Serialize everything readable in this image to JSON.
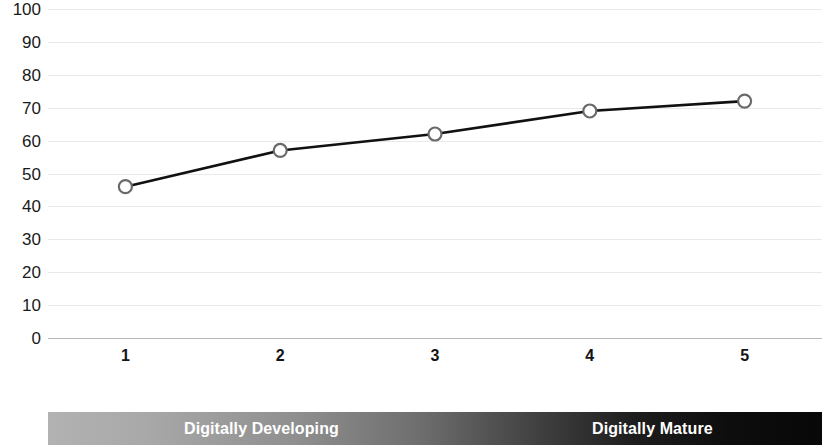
{
  "chart_data": {
    "type": "line",
    "title": "",
    "xlabel": "",
    "ylabel": "",
    "categories": [
      "1",
      "2",
      "3",
      "4",
      "5"
    ],
    "values": [
      46,
      57,
      62,
      69,
      72
    ],
    "series": [
      {
        "name": "Digital maturity score",
        "values": [
          46,
          57,
          62,
          69,
          72
        ]
      }
    ],
    "ylim": [
      0,
      100
    ],
    "y_ticks": [
      "100",
      "90",
      "80",
      "70",
      "60",
      "50",
      "40",
      "30",
      "20",
      "10",
      "0"
    ],
    "y_tick_values": [
      100,
      90,
      80,
      70,
      60,
      50,
      40,
      30,
      20,
      10,
      0
    ],
    "grid": true,
    "legend": "none",
    "marker": "open-circle",
    "line_color": "#111111",
    "marker_fill": "#ffffff",
    "marker_stroke": "#6a6a6a",
    "grid_color": "#e9e9e9",
    "axis_color": "#b8b8b8"
  },
  "spectrum": {
    "left_label": "Digitally Developing",
    "right_label": "Digitally Mature",
    "gradient_start": "#b2b2b2",
    "gradient_end": "#080808",
    "label_color": "#ffffff"
  }
}
